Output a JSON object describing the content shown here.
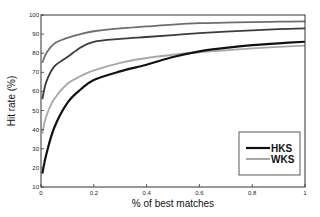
{
  "chart_data": {
    "type": "line",
    "title": "",
    "xlabel": "% of best matches",
    "ylabel": "Hit rate (%)",
    "xlim": [
      0,
      1
    ],
    "ylim": [
      10,
      100
    ],
    "grid": false,
    "legend_position": "lower right",
    "x_ticks": [
      "0",
      "0.2",
      "0.4",
      "0.6",
      "0.8",
      "1"
    ],
    "y_ticks": [
      "10",
      "20",
      "30",
      "40",
      "50",
      "60",
      "70",
      "80",
      "90",
      "100"
    ],
    "x": [
      0.005,
      0.02,
      0.05,
      0.1,
      0.15,
      0.2,
      0.3,
      0.4,
      0.5,
      0.6,
      0.7,
      0.8,
      0.9,
      1.0
    ],
    "series": [
      {
        "name": "",
        "color": "#6e6e6e",
        "width": 1.8,
        "values": [
          75,
          80,
          85,
          88,
          90,
          91.5,
          93,
          94,
          95,
          95.7,
          96,
          96.3,
          96.5,
          96.7
        ]
      },
      {
        "name": "",
        "color": "#3c3c3c",
        "width": 1.8,
        "values": [
          56,
          65,
          73,
          78,
          83,
          86,
          87.5,
          88.5,
          89.5,
          90.5,
          91.3,
          92,
          92.6,
          93
        ]
      },
      {
        "name": "WKS",
        "color": "#a8a8a8",
        "width": 1.8,
        "values": [
          38,
          47,
          56,
          64,
          68,
          71,
          75,
          77.5,
          79.2,
          80.5,
          81.5,
          82.5,
          83.3,
          84
        ]
      },
      {
        "name": "HKS",
        "color": "#111111",
        "width": 2.2,
        "values": [
          17,
          27,
          41,
          54,
          61,
          66,
          70.5,
          74,
          78,
          81,
          82.8,
          84.2,
          85.2,
          86
        ]
      }
    ],
    "legend": [
      {
        "label": "HKS",
        "color": "#111111"
      },
      {
        "label": "WKS",
        "color": "#a8a8a8"
      }
    ]
  }
}
